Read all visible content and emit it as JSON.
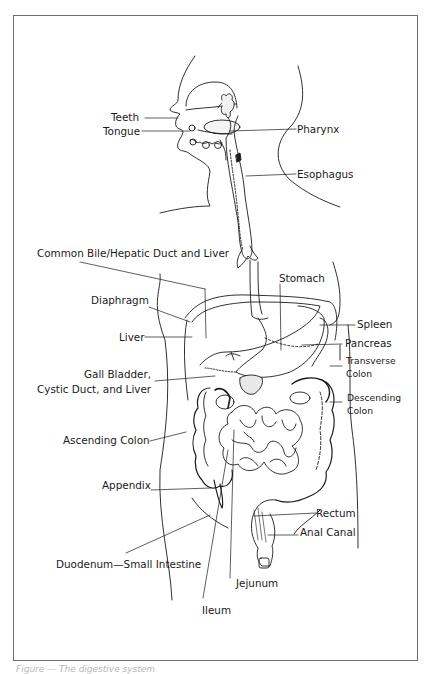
{
  "diagram": {
    "type": "anatomical-labeled-illustration",
    "line_color": "#1a1a1a",
    "frame_color": "#6e6e6e",
    "labels": {
      "teeth": "Teeth",
      "tongue": "Tongue",
      "pharynx": "Pharynx",
      "esophagus": "Esophagus",
      "common_bile": "Common Bile/Hepatic Duct and Liver",
      "stomach": "Stomach",
      "diaphragm": "Diaphragm",
      "spleen": "Spleen",
      "liver": "Liver",
      "pancreas": "Pancreas",
      "transverse_1": "Transverse",
      "transverse_2": "Colon",
      "gall_1": "Gall Bladder,",
      "gall_2": "Cystic Duct, and Liver",
      "descending_1": "Descending",
      "descending_2": "Colon",
      "ascending": "Ascending Colon",
      "appendix": "Appendix",
      "rectum": "Rectum",
      "anal_canal": "Anal Canal",
      "duodenum": "Duodenum—Small Intestine",
      "jejunum": "Jejunum",
      "ileum": "Ileum"
    },
    "caption": "Figure — The digestive system"
  }
}
